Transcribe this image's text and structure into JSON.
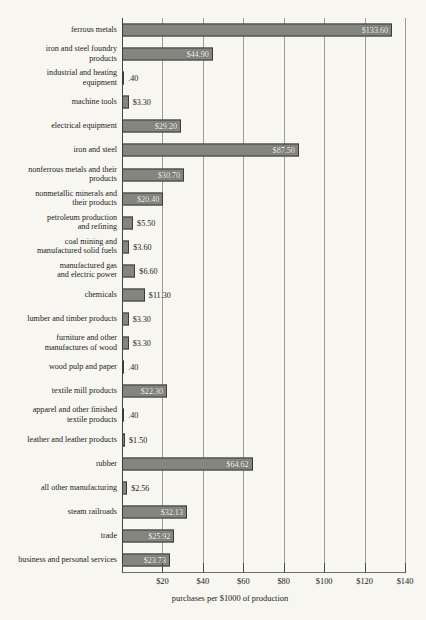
{
  "chart_data": {
    "type": "bar",
    "orientation": "horizontal",
    "title": "",
    "xlabel": "purchases per $1000 of production",
    "ylabel": "",
    "xlim": [
      0,
      140
    ],
    "xticks": [
      0,
      20,
      40,
      60,
      80,
      100,
      120,
      140
    ],
    "xtick_labels": [
      "",
      "$20",
      "$40",
      "$60",
      "$80",
      "$100",
      "$120",
      "$140"
    ],
    "grid": true,
    "legend": "none",
    "categories": [
      "ferrous metals",
      "iron and steel foundry\nproducts",
      "industrial and heating\nequipment",
      "machine tools",
      "electrical equipment",
      "iron and steel",
      "nonferrous metals and their\nproducts",
      "nonmetallic minerals and\ntheir products",
      "petroleum production\nand refining",
      "coal mining and\nmanufactured solid fuels",
      "manufactured gas\nand electric power",
      "chemicals",
      "lumber and timber products",
      "furniture and other\nmanufactures of wood",
      "wood pulp and paper",
      "textile mill products",
      "apparel and other finished\ntextile products",
      "leather and leather products",
      "rubber",
      "all other manufacturing",
      "steam railroads",
      "trade",
      "business and personal services"
    ],
    "values": [
      133.6,
      44.9,
      0.4,
      3.3,
      29.2,
      87.5,
      30.7,
      20.4,
      5.5,
      3.6,
      6.6,
      11.3,
      3.3,
      3.3,
      0.4,
      22.3,
      0.4,
      1.5,
      64.62,
      2.56,
      32.13,
      25.92,
      23.73
    ],
    "value_labels": [
      "$133.60",
      "$44.90",
      ".40",
      "$3.30",
      "$29.20",
      "$87.50",
      "$30.70",
      "$20.40",
      "$5.50",
      "$3.60",
      "$6.60",
      "$11.30",
      "$3.30",
      "$3.30",
      ".40",
      "$22.30",
      ".40",
      "$1.50",
      "$64.62",
      "$2.56",
      "$32.13",
      "$25.92",
      "$23.73"
    ],
    "label_placement": [
      "inside",
      "inside",
      "outside",
      "outside",
      "inside",
      "inside",
      "inside",
      "inside",
      "outside",
      "outside",
      "outside",
      "outside",
      "outside",
      "outside",
      "outside",
      "inside",
      "outside",
      "outside",
      "inside",
      "outside",
      "inside",
      "inside",
      "inside"
    ],
    "colors": {
      "bar_fill": "#85857f",
      "bar_edge": "#3b3b39",
      "background": "#f7f6f1",
      "grid": "#9a9a96",
      "text": "#1b1b1b"
    }
  }
}
